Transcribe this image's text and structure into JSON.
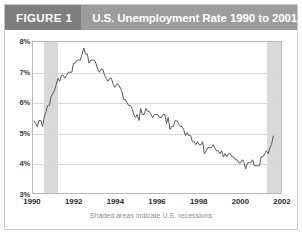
{
  "header": {
    "figure_tag": "FIGURE 1",
    "title": "U.S. Unemployment Rate 1990 to 2001"
  },
  "caption": "Shaded areas indicate U.S. recessions",
  "colors": {
    "header_bar": "#9c9c9c",
    "figure_tag_bg": "#7e7e7e",
    "line": "#595959",
    "recession_band": "#d9d9d9",
    "gridline": "#d6d6d6",
    "frame": "#b9b9b9"
  },
  "chart_data": {
    "type": "line",
    "title": "U.S. Unemployment Rate 1990 to 2001",
    "xlabel": "",
    "ylabel": "",
    "annotation": "Shaded areas indicate U.S. recessions",
    "grid": true,
    "legend": "none",
    "xlim": [
      1990.0,
      2002.0
    ],
    "ylim": [
      3,
      8
    ],
    "ytick_labels": [
      "8%",
      "7%",
      "6%",
      "5%",
      "4%",
      "3%"
    ],
    "ytick_values": [
      8,
      7,
      6,
      5,
      4,
      3
    ],
    "xtick_labels": [
      "1990",
      "1992",
      "1994",
      "1996",
      "1998",
      "2000",
      "2002"
    ],
    "xtick_values": [
      1990,
      1992,
      1994,
      1996,
      1998,
      2000,
      2002
    ],
    "shaded_regions": [
      {
        "label": "recession 1990-1991",
        "start": 1990.54,
        "end": 1991.2
      },
      {
        "label": "recession 2001",
        "start": 2001.21,
        "end": 2001.92
      }
    ],
    "series": [
      {
        "name": "U.S. Unemployment Rate",
        "x": [
          1990.04,
          1990.13,
          1990.21,
          1990.29,
          1990.38,
          1990.46,
          1990.54,
          1990.63,
          1990.71,
          1990.79,
          1990.88,
          1990.96,
          1991.04,
          1991.13,
          1991.21,
          1991.29,
          1991.38,
          1991.46,
          1991.54,
          1991.63,
          1991.71,
          1991.79,
          1991.88,
          1991.96,
          1992.04,
          1992.13,
          1992.21,
          1992.29,
          1992.38,
          1992.46,
          1992.54,
          1992.63,
          1992.71,
          1992.79,
          1992.88,
          1992.96,
          1993.04,
          1993.13,
          1993.21,
          1993.29,
          1993.38,
          1993.46,
          1993.54,
          1993.63,
          1993.71,
          1993.79,
          1993.88,
          1993.96,
          1994.04,
          1994.13,
          1994.21,
          1994.29,
          1994.38,
          1994.46,
          1994.54,
          1994.63,
          1994.71,
          1994.79,
          1994.88,
          1994.96,
          1995.04,
          1995.13,
          1995.21,
          1995.29,
          1995.38,
          1995.46,
          1995.54,
          1995.63,
          1995.71,
          1995.79,
          1995.88,
          1995.96,
          1996.04,
          1996.13,
          1996.21,
          1996.29,
          1996.38,
          1996.46,
          1996.54,
          1996.63,
          1996.71,
          1996.79,
          1996.88,
          1996.96,
          1997.04,
          1997.13,
          1997.21,
          1997.29,
          1997.38,
          1997.46,
          1997.54,
          1997.63,
          1997.71,
          1997.79,
          1997.88,
          1997.96,
          1998.04,
          1998.13,
          1998.21,
          1998.29,
          1998.38,
          1998.46,
          1998.54,
          1998.63,
          1998.71,
          1998.79,
          1998.88,
          1998.96,
          1999.04,
          1999.13,
          1999.21,
          1999.29,
          1999.38,
          1999.46,
          1999.54,
          1999.63,
          1999.71,
          1999.79,
          1999.88,
          1999.96,
          2000.04,
          2000.13,
          2000.21,
          2000.29,
          2000.38,
          2000.46,
          2000.54,
          2000.63,
          2000.71,
          2000.79,
          2000.88,
          2000.96,
          2001.04,
          2001.13,
          2001.21,
          2001.29,
          2001.38,
          2001.46,
          2001.54,
          2001.63
        ],
        "values": [
          5.4,
          5.3,
          5.2,
          5.4,
          5.4,
          5.2,
          5.5,
          5.7,
          5.9,
          5.9,
          6.2,
          6.3,
          6.4,
          6.6,
          6.8,
          6.7,
          6.9,
          6.9,
          6.8,
          6.9,
          7.0,
          7.0,
          7.0,
          7.3,
          7.3,
          7.4,
          7.4,
          7.4,
          7.6,
          7.8,
          7.6,
          7.6,
          7.3,
          7.4,
          7.4,
          7.4,
          7.3,
          7.1,
          7.0,
          7.1,
          7.1,
          6.9,
          6.8,
          6.7,
          6.8,
          6.8,
          6.6,
          6.5,
          6.6,
          6.6,
          6.5,
          6.4,
          6.1,
          6.1,
          6.0,
          5.9,
          5.9,
          5.8,
          5.6,
          5.5,
          5.6,
          5.4,
          5.8,
          5.6,
          5.6,
          5.8,
          5.7,
          5.7,
          5.6,
          5.5,
          5.6,
          5.6,
          5.6,
          5.5,
          5.5,
          5.6,
          5.6,
          5.3,
          5.5,
          5.1,
          5.2,
          5.2,
          5.4,
          5.4,
          5.3,
          5.2,
          5.2,
          5.1,
          4.9,
          5.0,
          4.9,
          4.9,
          4.7,
          4.7,
          4.6,
          4.7,
          4.6,
          4.6,
          4.7,
          4.3,
          4.4,
          4.5,
          4.5,
          4.5,
          4.6,
          4.5,
          4.4,
          4.4,
          4.3,
          4.4,
          4.2,
          4.3,
          4.2,
          4.3,
          4.3,
          4.2,
          4.2,
          4.1,
          4.1,
          4.0,
          4.0,
          4.1,
          4.0,
          3.8,
          4.0,
          4.0,
          4.0,
          4.1,
          3.9,
          3.9,
          3.9,
          3.9,
          4.2,
          4.2,
          4.3,
          4.4,
          4.3,
          4.5,
          4.6,
          4.9
        ]
      }
    ]
  }
}
